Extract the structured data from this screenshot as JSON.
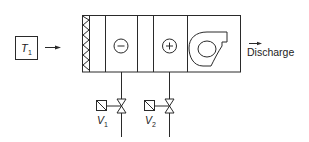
{
  "diagram": {
    "sensor": {
      "symbol": "T",
      "subscript": "1",
      "label": "T1"
    },
    "outlet_label": "Discharge",
    "sections": [
      {
        "id": "filter",
        "icon": "filter-zigzag-icon"
      },
      {
        "id": "empty-1"
      },
      {
        "id": "cooling-coil",
        "symbol": "−",
        "icon": "minus-circle-icon"
      },
      {
        "id": "empty-2"
      },
      {
        "id": "heating-coil",
        "symbol": "+",
        "icon": "plus-circle-icon"
      },
      {
        "id": "fan",
        "icon": "centrifugal-fan-icon"
      }
    ],
    "valves": [
      {
        "symbol": "V",
        "subscript": "1",
        "label": "V1",
        "serves": "cooling-coil"
      },
      {
        "symbol": "V",
        "subscript": "2",
        "label": "V2",
        "serves": "heating-coil"
      }
    ]
  }
}
